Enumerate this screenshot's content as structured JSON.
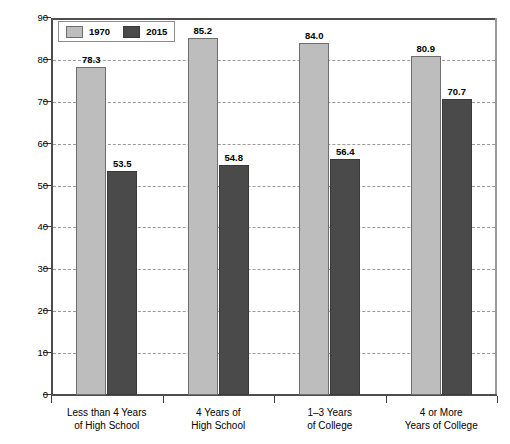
{
  "chart_data": {
    "type": "bar",
    "title": "",
    "xlabel": "",
    "ylabel": "Percent",
    "ylim": [
      0,
      90
    ],
    "ytick_step": 10,
    "yticks": [
      "0",
      "10",
      "20",
      "30",
      "40",
      "50",
      "60",
      "70",
      "80",
      "90"
    ],
    "grid": true,
    "grid_style": "dashed-horizontal",
    "legend_position": "top-left-inside",
    "categories": [
      "Less than 4 Years of High School",
      "4 Years of High School",
      "1–3 Years of College",
      "4 or More Years of College"
    ],
    "category_lines": [
      [
        "Less than 4 Years",
        "of High School"
      ],
      [
        "4 Years of",
        "High School"
      ],
      [
        "1–3 Years",
        "of College"
      ],
      [
        "4 or More",
        "Years of College"
      ]
    ],
    "series": [
      {
        "name": "1970",
        "color": "#bdbdbd",
        "values": [
          78.3,
          85.2,
          84.0,
          80.9
        ],
        "labels": [
          "78.3",
          "85.2",
          "84.0",
          "80.9"
        ]
      },
      {
        "name": "2015",
        "color": "#4a4a4a",
        "values": [
          53.5,
          54.8,
          56.4,
          70.7
        ],
        "labels": [
          "53.5",
          "54.8",
          "56.4",
          "70.7"
        ]
      }
    ]
  },
  "legend": {
    "entries": [
      {
        "label": "1970",
        "swatch": "light-gray"
      },
      {
        "label": "2015",
        "swatch": "dark-gray"
      }
    ]
  },
  "axes": {
    "y_title": "Percent"
  },
  "colors": {
    "series_1970": "#bdbdbd",
    "series_2015": "#4a4a4a",
    "axis": "#4d4d4d",
    "grid": "#9a9a9a",
    "background": "#ffffff"
  }
}
